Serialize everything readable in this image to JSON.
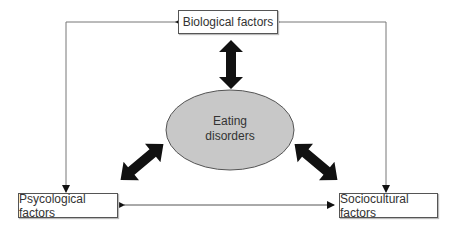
{
  "diagram": {
    "center": {
      "line1": "Eating",
      "line2": "disorders",
      "fill": "#c8c8c8"
    },
    "nodes": {
      "biological": "Biological factors",
      "psychological": "Psycological factors",
      "sociocultural": "Sociocultural factors"
    },
    "connections": [
      {
        "from": "biological",
        "to": "eating disorders",
        "type": "bold double arrow"
      },
      {
        "from": "psychological",
        "to": "eating disorders",
        "type": "bold double arrow"
      },
      {
        "from": "sociocultural",
        "to": "eating disorders",
        "type": "bold double arrow"
      },
      {
        "from": "biological",
        "to": "psychological",
        "type": "thin double arrow"
      },
      {
        "from": "biological",
        "to": "sociocultural",
        "type": "thin double arrow"
      },
      {
        "from": "psychological",
        "to": "sociocultural",
        "type": "thin double arrow"
      }
    ]
  }
}
